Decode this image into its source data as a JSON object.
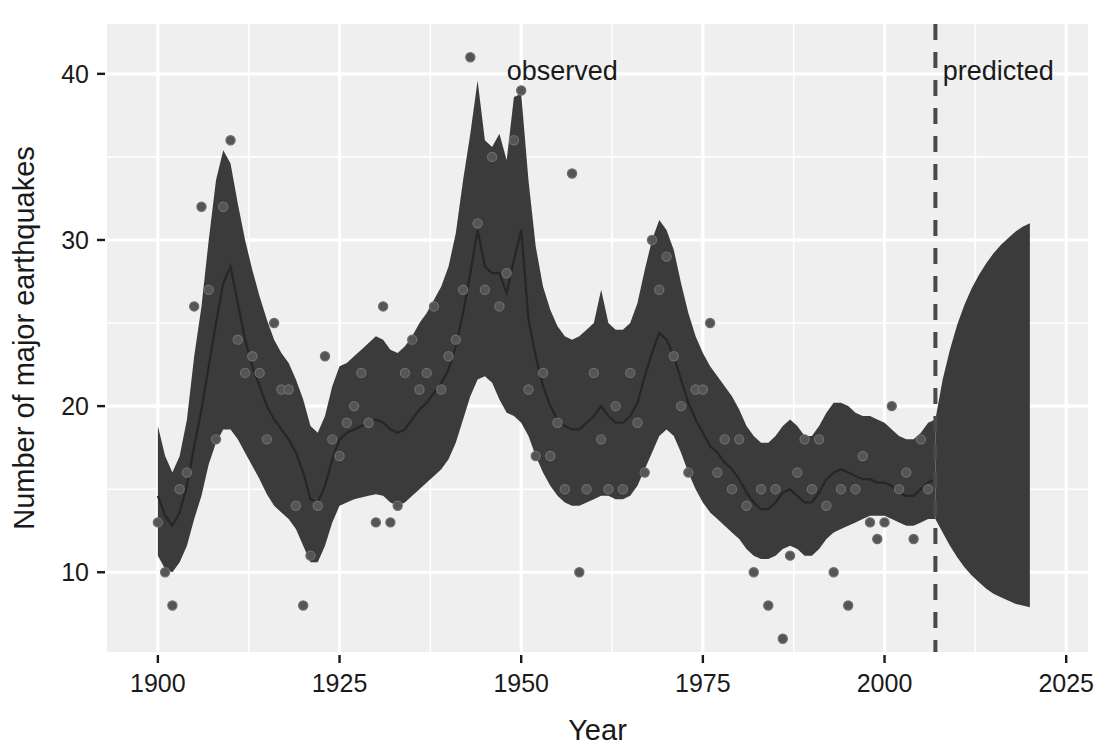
{
  "figure": {
    "background": "#ffffff",
    "panel_background": "#efefef",
    "grid_color": "#ffffff",
    "band_color": "#3b3b3b",
    "line_color": "#262626",
    "point_color": "#555555",
    "divider_color": "#4a4a4a",
    "top_clipped_text": ""
  },
  "chart_data": {
    "type": "area",
    "title": "",
    "subtitle": "",
    "xlabel": "Year",
    "ylabel": "Number of major earthquakes",
    "xlim": [
      1893,
      2028
    ],
    "ylim": [
      5.2,
      43.0
    ],
    "xticks": [
      1900,
      1925,
      1950,
      1975,
      2000,
      2025
    ],
    "xtick_labels": [
      "1900",
      "1925",
      "1950",
      "1975",
      "2000",
      "2025"
    ],
    "yticks": [
      10,
      20,
      30,
      40
    ],
    "ytick_labels": [
      "10",
      "20",
      "30",
      "40"
    ],
    "x_minor_ticks": [
      1912.5,
      1937.5,
      1962.5,
      1987.5,
      2012.5
    ],
    "y_minor_ticks": [
      15,
      25,
      35
    ],
    "grid": true,
    "legend": "none",
    "annotations": [
      {
        "text": "observed",
        "x": 1948,
        "y": 39.6,
        "anchor": "start"
      },
      {
        "text": "predicted",
        "x": 2008,
        "y": 39.6,
        "anchor": "start"
      }
    ],
    "divider_line": {
      "x": 2007,
      "style": "dashed"
    },
    "series": [
      {
        "name": "credible interval band (observed)",
        "type": "ribbon",
        "x": [
          1900,
          1901,
          1902,
          1903,
          1904,
          1905,
          1906,
          1907,
          1908,
          1909,
          1910,
          1911,
          1912,
          1913,
          1914,
          1915,
          1916,
          1917,
          1918,
          1919,
          1920,
          1921,
          1922,
          1923,
          1924,
          1925,
          1926,
          1927,
          1928,
          1929,
          1930,
          1931,
          1932,
          1933,
          1934,
          1935,
          1936,
          1937,
          1938,
          1939,
          1940,
          1941,
          1942,
          1943,
          1944,
          1945,
          1946,
          1947,
          1948,
          1949,
          1950,
          1951,
          1952,
          1953,
          1954,
          1955,
          1956,
          1957,
          1958,
          1959,
          1960,
          1961,
          1962,
          1963,
          1964,
          1965,
          1966,
          1967,
          1968,
          1969,
          1970,
          1971,
          1972,
          1973,
          1974,
          1975,
          1976,
          1977,
          1978,
          1979,
          1980,
          1981,
          1982,
          1983,
          1984,
          1985,
          1986,
          1987,
          1988,
          1989,
          1990,
          1991,
          1992,
          1993,
          1994,
          1995,
          1996,
          1997,
          1998,
          1999,
          2000,
          2001,
          2002,
          2003,
          2004,
          2005,
          2006,
          2007
        ],
        "lower": [
          11.0,
          10.2,
          10.0,
          10.6,
          11.6,
          13.2,
          14.6,
          16.5,
          17.8,
          18.6,
          18.6,
          18.0,
          17.2,
          16.4,
          15.6,
          14.7,
          14.0,
          13.6,
          13.2,
          12.6,
          11.6,
          10.6,
          10.6,
          11.6,
          13.0,
          14.0,
          14.2,
          14.4,
          14.5,
          14.6,
          14.7,
          14.6,
          14.2,
          14.0,
          14.2,
          14.6,
          15.0,
          15.4,
          15.8,
          16.2,
          16.8,
          17.8,
          19.2,
          20.6,
          21.6,
          21.8,
          21.4,
          20.4,
          19.6,
          19.4,
          19.0,
          18.2,
          17.0,
          16.0,
          15.2,
          14.6,
          14.2,
          14.0,
          14.0,
          14.2,
          14.4,
          14.6,
          14.6,
          14.4,
          14.4,
          14.6,
          15.2,
          16.2,
          17.2,
          18.2,
          18.6,
          18.2,
          17.2,
          16.0,
          15.0,
          14.2,
          13.6,
          13.2,
          12.8,
          12.4,
          12.0,
          11.4,
          11.0,
          10.8,
          10.8,
          11.0,
          11.4,
          11.6,
          11.4,
          11.0,
          11.0,
          11.4,
          12.0,
          12.4,
          12.6,
          12.8,
          13.0,
          13.2,
          13.4,
          13.4,
          13.4,
          13.2,
          13.0,
          12.8,
          12.8,
          13.0,
          13.2,
          13.2
        ],
        "upper": [
          18.8,
          17.0,
          16.0,
          17.0,
          19.2,
          23.0,
          26.0,
          30.0,
          33.6,
          35.4,
          34.6,
          32.2,
          30.0,
          28.2,
          26.6,
          25.2,
          24.0,
          23.2,
          22.6,
          21.6,
          20.4,
          18.8,
          18.4,
          19.4,
          21.2,
          22.4,
          22.6,
          23.0,
          23.4,
          23.8,
          24.2,
          24.0,
          23.4,
          23.2,
          23.6,
          24.2,
          25.0,
          25.6,
          26.4,
          27.2,
          28.4,
          30.4,
          33.6,
          36.4,
          39.6,
          36.0,
          35.6,
          36.4,
          34.8,
          38.6,
          38.8,
          33.6,
          29.6,
          27.2,
          25.8,
          24.8,
          24.2,
          24.0,
          24.2,
          24.6,
          25.0,
          27.0,
          25.0,
          24.6,
          24.6,
          25.0,
          26.2,
          28.2,
          30.0,
          31.2,
          30.6,
          29.4,
          27.4,
          25.6,
          24.2,
          23.2,
          22.4,
          21.8,
          21.2,
          20.6,
          19.8,
          18.8,
          18.2,
          17.8,
          17.8,
          18.2,
          18.8,
          19.2,
          18.8,
          18.2,
          18.2,
          18.8,
          19.6,
          20.2,
          20.2,
          20.0,
          19.6,
          19.4,
          19.4,
          19.2,
          19.0,
          18.6,
          18.2,
          18.0,
          18.0,
          18.4,
          19.0,
          19.2
        ]
      },
      {
        "name": "posterior median (observed)",
        "type": "line",
        "x": [
          1900,
          1901,
          1902,
          1903,
          1904,
          1905,
          1906,
          1907,
          1908,
          1909,
          1910,
          1911,
          1912,
          1913,
          1914,
          1915,
          1916,
          1917,
          1918,
          1919,
          1920,
          1921,
          1922,
          1923,
          1924,
          1925,
          1926,
          1927,
          1928,
          1929,
          1930,
          1931,
          1932,
          1933,
          1934,
          1935,
          1936,
          1937,
          1938,
          1939,
          1940,
          1941,
          1942,
          1943,
          1944,
          1945,
          1946,
          1947,
          1948,
          1949,
          1950,
          1951,
          1952,
          1953,
          1954,
          1955,
          1956,
          1957,
          1958,
          1959,
          1960,
          1961,
          1962,
          1963,
          1964,
          1965,
          1966,
          1967,
          1968,
          1969,
          1970,
          1971,
          1972,
          1973,
          1974,
          1975,
          1976,
          1977,
          1978,
          1979,
          1980,
          1981,
          1982,
          1983,
          1984,
          1985,
          1986,
          1987,
          1988,
          1989,
          1990,
          1991,
          1992,
          1993,
          1994,
          1995,
          1996,
          1997,
          1998,
          1999,
          2000,
          2001,
          2002,
          2003,
          2004,
          2005,
          2006,
          2007
        ],
        "values": [
          14.6,
          13.4,
          12.8,
          13.6,
          15.2,
          17.6,
          19.8,
          22.4,
          25.0,
          27.4,
          28.4,
          26.2,
          24.0,
          22.4,
          21.2,
          20.0,
          19.2,
          18.6,
          18.0,
          17.2,
          16.0,
          14.4,
          14.2,
          15.2,
          16.8,
          18.0,
          18.4,
          18.6,
          18.8,
          19.0,
          19.2,
          19.0,
          18.6,
          18.4,
          18.6,
          19.2,
          19.8,
          20.2,
          20.8,
          21.4,
          22.2,
          23.6,
          25.6,
          28.0,
          30.6,
          28.4,
          28.0,
          28.0,
          26.8,
          28.8,
          30.6,
          25.2,
          23.0,
          21.2,
          20.0,
          19.2,
          18.8,
          18.6,
          18.6,
          19.0,
          19.4,
          20.0,
          19.4,
          19.0,
          19.0,
          19.4,
          20.2,
          21.8,
          23.2,
          24.4,
          24.0,
          23.0,
          21.6,
          20.2,
          19.2,
          18.4,
          17.6,
          17.2,
          16.6,
          16.2,
          15.6,
          14.8,
          14.2,
          13.8,
          13.8,
          14.2,
          14.8,
          15.0,
          14.6,
          14.2,
          14.2,
          14.8,
          15.6,
          16.0,
          16.2,
          16.0,
          15.8,
          15.6,
          15.6,
          15.4,
          15.4,
          15.2,
          14.8,
          14.6,
          14.6,
          15.0,
          15.4,
          15.6
        ]
      },
      {
        "name": "forecast band (predicted)",
        "type": "ribbon",
        "x": [
          2007,
          2008,
          2009,
          2010,
          2011,
          2012,
          2013,
          2014,
          2015,
          2016,
          2017,
          2018,
          2019,
          2020
        ],
        "lower": [
          13.2,
          12.4,
          11.6,
          10.9,
          10.3,
          9.8,
          9.4,
          9.0,
          8.7,
          8.5,
          8.3,
          8.1,
          8.0,
          7.9
        ],
        "upper": [
          19.2,
          21.6,
          23.4,
          24.9,
          26.1,
          27.1,
          27.9,
          28.6,
          29.2,
          29.7,
          30.1,
          30.5,
          30.8,
          31.0
        ]
      }
    ],
    "points": {
      "name": "observed counts",
      "x": [
        1900,
        1901,
        1902,
        1903,
        1904,
        1905,
        1906,
        1907,
        1908,
        1909,
        1910,
        1911,
        1912,
        1913,
        1914,
        1915,
        1916,
        1917,
        1918,
        1919,
        1920,
        1921,
        1922,
        1923,
        1924,
        1925,
        1926,
        1927,
        1928,
        1929,
        1930,
        1931,
        1932,
        1933,
        1934,
        1935,
        1936,
        1937,
        1938,
        1939,
        1940,
        1941,
        1942,
        1943,
        1944,
        1945,
        1946,
        1947,
        1948,
        1949,
        1950,
        1951,
        1952,
        1953,
        1954,
        1955,
        1956,
        1957,
        1958,
        1959,
        1960,
        1961,
        1962,
        1963,
        1964,
        1965,
        1966,
        1967,
        1968,
        1969,
        1970,
        1971,
        1972,
        1973,
        1974,
        1975,
        1976,
        1977,
        1978,
        1979,
        1980,
        1981,
        1982,
        1983,
        1984,
        1985,
        1986,
        1987,
        1988,
        1989,
        1990,
        1991,
        1992,
        1993,
        1994,
        1995,
        1996,
        1997,
        1998,
        1999,
        2000,
        2001,
        2002,
        2003,
        2004,
        2005,
        2006
      ],
      "values": [
        13,
        10,
        8,
        15,
        16,
        26,
        32,
        27,
        18,
        32,
        36,
        24,
        22,
        23,
        22,
        18,
        25,
        21,
        21,
        14,
        8,
        11,
        14,
        23,
        18,
        17,
        19,
        20,
        22,
        19,
        13,
        26,
        13,
        14,
        22,
        24,
        21,
        22,
        26,
        21,
        23,
        24,
        27,
        41,
        31,
        27,
        35,
        26,
        28,
        36,
        39,
        21,
        17,
        22,
        17,
        19,
        15,
        34,
        10,
        15,
        22,
        18,
        15,
        20,
        15,
        22,
        19,
        16,
        30,
        27,
        29,
        23,
        20,
        16,
        21,
        21,
        25,
        16,
        18,
        15,
        18,
        14,
        10,
        15,
        8,
        15,
        6,
        11,
        16,
        18,
        15,
        18,
        14,
        10,
        15,
        8,
        15,
        17,
        13,
        12,
        13,
        20,
        15,
        16,
        12,
        18,
        15
      ]
    }
  }
}
